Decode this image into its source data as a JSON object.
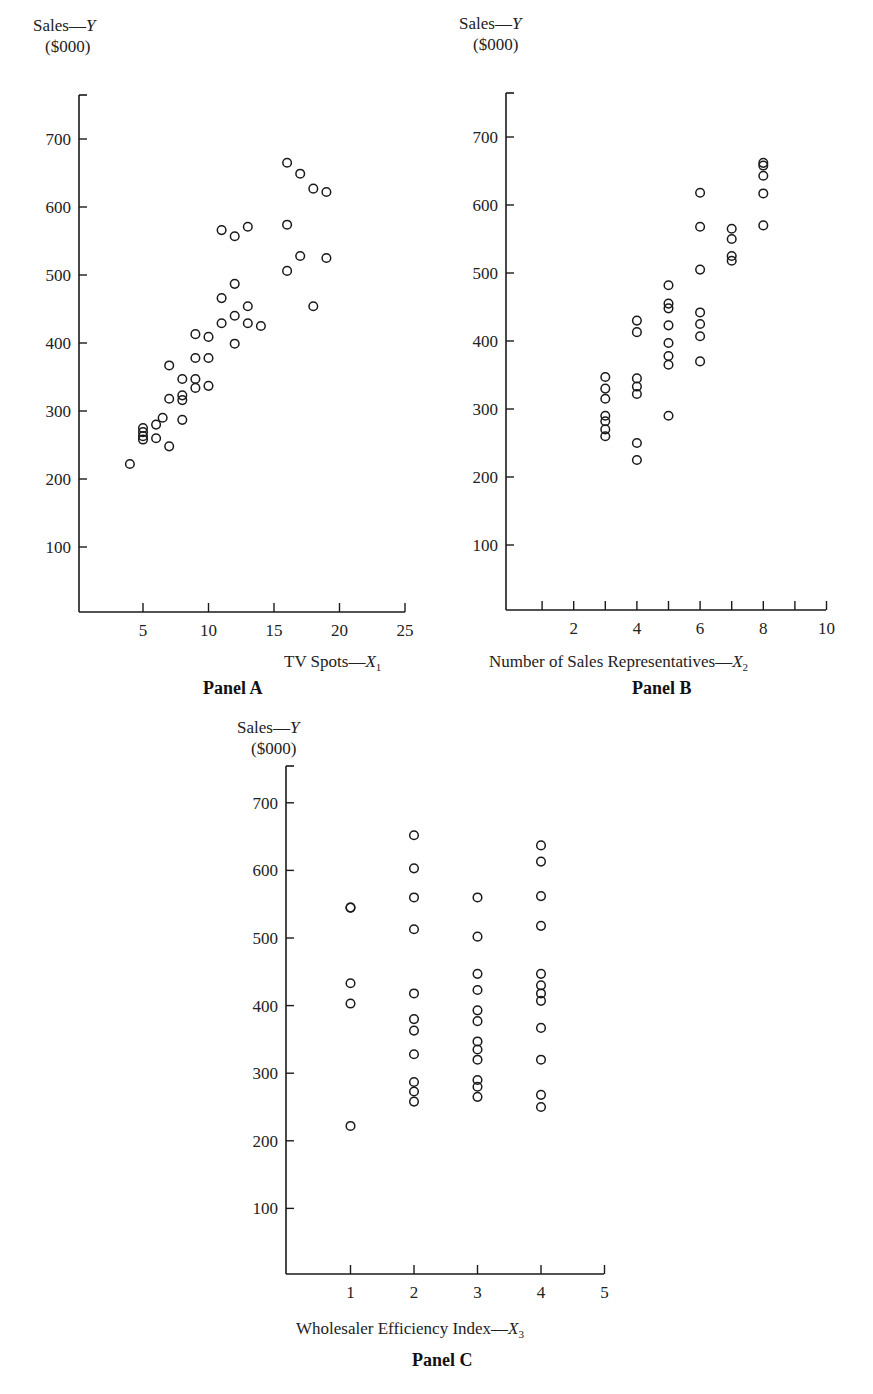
{
  "chart_data": [
    {
      "type": "scatter",
      "title": "Panel A",
      "xlabel": "TV Spots—X1",
      "ylabel": "Sales—Y",
      "ylabel_units": "($000)",
      "xlim": [
        0,
        25
      ],
      "ylim": [
        0,
        750
      ],
      "xticks": [
        5,
        10,
        15,
        20,
        25
      ],
      "yticks": [
        100,
        200,
        300,
        400,
        500,
        600,
        700
      ],
      "grid": false,
      "marker": "open-circle",
      "points": [
        [
          4,
          222
        ],
        [
          5,
          275
        ],
        [
          5,
          269
        ],
        [
          5,
          263
        ],
        [
          5,
          258
        ],
        [
          6,
          280
        ],
        [
          6,
          260
        ],
        [
          6.5,
          290
        ],
        [
          7,
          367
        ],
        [
          7,
          318
        ],
        [
          7,
          248
        ],
        [
          8,
          347
        ],
        [
          8,
          323
        ],
        [
          8,
          316
        ],
        [
          8,
          287
        ],
        [
          9,
          413
        ],
        [
          9,
          378
        ],
        [
          9,
          347
        ],
        [
          9,
          334
        ],
        [
          10,
          409
        ],
        [
          10,
          378
        ],
        [
          10,
          337
        ],
        [
          11,
          566
        ],
        [
          11,
          466
        ],
        [
          11,
          429
        ],
        [
          12,
          557
        ],
        [
          12,
          487
        ],
        [
          12,
          440
        ],
        [
          12,
          399
        ],
        [
          13,
          571
        ],
        [
          13,
          454
        ],
        [
          13,
          429
        ],
        [
          14,
          425
        ],
        [
          16,
          665
        ],
        [
          16,
          574
        ],
        [
          16,
          506
        ],
        [
          17,
          649
        ],
        [
          17,
          528
        ],
        [
          18,
          627
        ],
        [
          18,
          454
        ],
        [
          19,
          622
        ],
        [
          19,
          525
        ]
      ]
    },
    {
      "type": "scatter",
      "title": "Panel B",
      "xlabel": "Number of Sales Representatives—X2",
      "ylabel": "Sales—Y",
      "ylabel_units": "($000)",
      "xlim": [
        0,
        10
      ],
      "ylim": [
        0,
        750
      ],
      "xticks": [
        2,
        4,
        6,
        8,
        10
      ],
      "xminor_ticks": [
        1,
        3,
        5,
        7,
        9
      ],
      "yticks": [
        100,
        200,
        300,
        400,
        500,
        600,
        700
      ],
      "grid": false,
      "marker": "open-circle",
      "points": [
        [
          3,
          347
        ],
        [
          3,
          330
        ],
        [
          3,
          315
        ],
        [
          3,
          290
        ],
        [
          3,
          282
        ],
        [
          3,
          270
        ],
        [
          3,
          260
        ],
        [
          4,
          430
        ],
        [
          4,
          413
        ],
        [
          4,
          345
        ],
        [
          4,
          333
        ],
        [
          4,
          322
        ],
        [
          4,
          250
        ],
        [
          4,
          225
        ],
        [
          5,
          482
        ],
        [
          5,
          455
        ],
        [
          5,
          448
        ],
        [
          5,
          423
        ],
        [
          5,
          397
        ],
        [
          5,
          378
        ],
        [
          5,
          365
        ],
        [
          5,
          290
        ],
        [
          6,
          618
        ],
        [
          6,
          568
        ],
        [
          6,
          505
        ],
        [
          6,
          442
        ],
        [
          6,
          425
        ],
        [
          6,
          407
        ],
        [
          6,
          370
        ],
        [
          7,
          565
        ],
        [
          7,
          550
        ],
        [
          7,
          525
        ],
        [
          7,
          518
        ],
        [
          8,
          662
        ],
        [
          8,
          658
        ],
        [
          8,
          643
        ],
        [
          8,
          617
        ],
        [
          8,
          570
        ]
      ]
    },
    {
      "type": "scatter",
      "title": "Panel C",
      "xlabel": "Wholesaler Efficiency Index—X3",
      "ylabel": "Sales—Y",
      "ylabel_units": "($000)",
      "xlim": [
        0,
        5
      ],
      "ylim": [
        0,
        750
      ],
      "xticks": [
        1,
        2,
        3,
        4,
        5
      ],
      "yticks": [
        100,
        200,
        300,
        400,
        500,
        600,
        700
      ],
      "grid": false,
      "marker": "open-circle",
      "points": [
        [
          1,
          545
        ],
        [
          1,
          545
        ],
        [
          1,
          433
        ],
        [
          1,
          403
        ],
        [
          1,
          222
        ],
        [
          2,
          652
        ],
        [
          2,
          603
        ],
        [
          2,
          560
        ],
        [
          2,
          513
        ],
        [
          2,
          418
        ],
        [
          2,
          380
        ],
        [
          2,
          363
        ],
        [
          2,
          328
        ],
        [
          2,
          287
        ],
        [
          2,
          273
        ],
        [
          2,
          258
        ],
        [
          3,
          560
        ],
        [
          3,
          502
        ],
        [
          3,
          447
        ],
        [
          3,
          423
        ],
        [
          3,
          393
        ],
        [
          3,
          377
        ],
        [
          3,
          347
        ],
        [
          3,
          335
        ],
        [
          3,
          320
        ],
        [
          3,
          290
        ],
        [
          3,
          280
        ],
        [
          3,
          265
        ],
        [
          4,
          637
        ],
        [
          4,
          613
        ],
        [
          4,
          562
        ],
        [
          4,
          518
        ],
        [
          4,
          447
        ],
        [
          4,
          430
        ],
        [
          4,
          418
        ],
        [
          4,
          407
        ],
        [
          4,
          367
        ],
        [
          4,
          320
        ],
        [
          4,
          268
        ],
        [
          4,
          250
        ]
      ]
    }
  ],
  "labels": {
    "panelA": {
      "y1": "Sales—",
      "yvar": "Y",
      "y2": "($000)",
      "x": "TV Spots—",
      "xvar": "X",
      "xsub": "1",
      "name": "Panel A"
    },
    "panelB": {
      "y1": "Sales—",
      "yvar": "Y",
      "y2": "($000)",
      "x": "Number of Sales Representatives—",
      "xvar": "X",
      "xsub": "2",
      "name": "Panel B"
    },
    "panelC": {
      "y1": "Sales—",
      "yvar": "Y",
      "y2": "($000)",
      "x": "Wholesaler Efficiency Index—",
      "xvar": "X",
      "xsub": "3",
      "name": "Panel C"
    }
  },
  "colors": {
    "ink": "#1a1a1a",
    "background": "#ffffff"
  }
}
